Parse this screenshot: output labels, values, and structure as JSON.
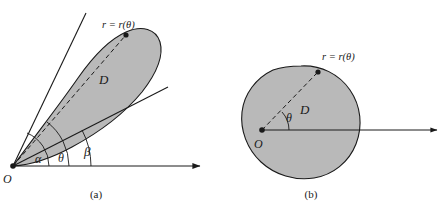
{
  "figure": {
    "title_visible": false,
    "background_color": "#ffffff",
    "stroke_color": "#1a1a1a",
    "region_fill_color": "#b9b9b9",
    "panels": [
      {
        "id": "a",
        "caption": "(a)",
        "origin_label": "O",
        "region_label": "D",
        "radius_label": "r = r(θ)",
        "angle_labels": [
          "α",
          "θ",
          "β"
        ],
        "axis_label": "",
        "rays": [
          {
            "name": "alpha-ray",
            "angle_deg": 66
          },
          {
            "name": "theta-ray",
            "angle_deg": 52,
            "dashed": true
          },
          {
            "name": "beta-ray",
            "angle_deg": 27
          },
          {
            "name": "polar-axis",
            "angle_deg": 0,
            "arrow": true
          }
        ]
      },
      {
        "id": "b",
        "caption": "(b)",
        "origin_label": "O",
        "region_label": "D",
        "radius_label": "r = r(θ)",
        "angle_labels": [
          "θ"
        ],
        "axis_label": "",
        "rays": [
          {
            "name": "theta-ray",
            "angle_deg": 41,
            "dashed": true
          },
          {
            "name": "polar-axis",
            "angle_deg": 0,
            "arrow": true
          }
        ]
      }
    ]
  }
}
